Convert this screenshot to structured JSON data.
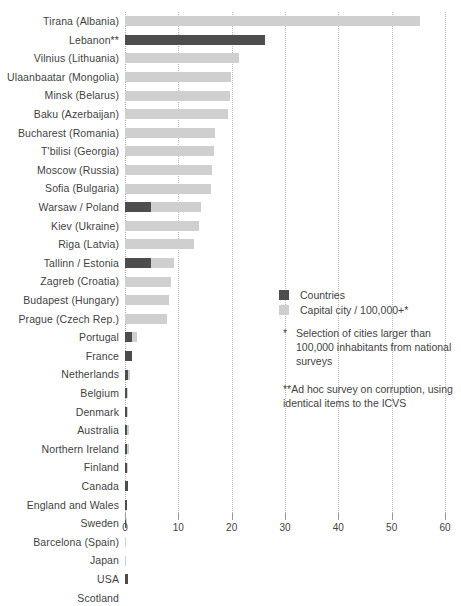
{
  "chart_data": {
    "type": "bar",
    "orientation": "horizontal",
    "title": "",
    "xlabel": "",
    "ylabel": "",
    "xlim": [
      0,
      60
    ],
    "xticks": [
      0,
      10,
      20,
      30,
      40,
      50,
      60
    ],
    "grid": true,
    "legend_position": "inside-right",
    "series": [
      {
        "name": "Countries",
        "color": "#4d4d4d"
      },
      {
        "name": "Capital city / 100,000+*",
        "color": "#cfcfcf"
      }
    ],
    "categories": [
      "Tirana (Albania)",
      "Lebanon**",
      "Vilnius (Lithuania)",
      "Ulaanbaatar (Mongolia)",
      "Minsk (Belarus)",
      "Baku (Azerbaijan)",
      "Bucharest (Romania)",
      "T'bilisi (Georgia)",
      "Moscow (Russia)",
      "Sofia (Bulgaria)",
      "Warsaw / Poland",
      "Kiev (Ukraine)",
      "Riga (Latvia)",
      "Tallinn / Estonia",
      "Zagreb (Croatia)",
      "Budapest (Hungary)",
      "Prague (Czech Rep.)",
      "Portugal",
      "France",
      "Netherlands",
      "Belgium",
      "Denmark",
      "Australia",
      "Northern Ireland",
      "Finland",
      "Canada",
      "England and Wales",
      "Sweden",
      "Barcelona (Spain)",
      "Japan",
      "USA",
      "Scotland"
    ],
    "rows": [
      {
        "label": "Tirana (Albania)",
        "city": 55.4,
        "country": 0
      },
      {
        "label": "Lebanon**",
        "city": 0,
        "country": 26.3
      },
      {
        "label": "Vilnius (Lithuania)",
        "city": 21.4,
        "country": 0
      },
      {
        "label": "Ulaanbaatar (Mongolia)",
        "city": 19.8,
        "country": 0
      },
      {
        "label": "Minsk (Belarus)",
        "city": 19.6,
        "country": 0
      },
      {
        "label": "Baku (Azerbaijan)",
        "city": 19.4,
        "country": 0
      },
      {
        "label": "Bucharest (Romania)",
        "city": 16.9,
        "country": 0
      },
      {
        "label": "T'bilisi (Georgia)",
        "city": 16.6,
        "country": 0
      },
      {
        "label": "Moscow (Russia)",
        "city": 16.4,
        "country": 0
      },
      {
        "label": "Sofia (Bulgaria)",
        "city": 16.2,
        "country": 0
      },
      {
        "label": "Warsaw / Poland",
        "city": 14.3,
        "country": 4.9
      },
      {
        "label": "Kiev (Ukraine)",
        "city": 13.9,
        "country": 0
      },
      {
        "label": "Riga (Latvia)",
        "city": 12.9,
        "country": 0
      },
      {
        "label": "Tallinn / Estonia",
        "city": 9.1,
        "country": 4.9
      },
      {
        "label": "Zagreb (Croatia)",
        "city": 8.6,
        "country": 0
      },
      {
        "label": "Budapest (Hungary)",
        "city": 8.3,
        "country": 0
      },
      {
        "label": "Prague (Czech Rep.)",
        "city": 7.9,
        "country": 0
      },
      {
        "label": "Portugal",
        "city": 2.3,
        "country": 1.4
      },
      {
        "label": "France",
        "city": 0,
        "country": 1.4
      },
      {
        "label": "Netherlands",
        "city": 0.9,
        "country": 0.5
      },
      {
        "label": "Belgium",
        "city": 0.6,
        "country": 0.4
      },
      {
        "label": "Denmark",
        "city": 0.5,
        "country": 0.4
      },
      {
        "label": "Australia",
        "city": 0.7,
        "country": 0.4
      },
      {
        "label": "Northern Ireland",
        "city": 0.8,
        "country": 0.4
      },
      {
        "label": "Finland",
        "city": 0.5,
        "country": 0.4
      },
      {
        "label": "Canada",
        "city": 0.5,
        "country": 0.5
      },
      {
        "label": "England and Wales",
        "city": 0.4,
        "country": 0.35
      },
      {
        "label": "Sweden",
        "city": 0.3,
        "country": 0.25
      },
      {
        "label": "Barcelona (Spain)",
        "city": 0.1,
        "country": 0
      },
      {
        "label": "Japan",
        "city": 0.1,
        "country": 0
      },
      {
        "label": "USA",
        "city": 0,
        "country": 0.5
      },
      {
        "label": "Scotland",
        "city": 0,
        "country": 0
      }
    ]
  },
  "legend": {
    "items": [
      {
        "label": "Countries",
        "color": "#4d4d4d"
      },
      {
        "label": "Capital city / 100,000+*",
        "color": "#cfcfcf"
      }
    ]
  },
  "notes": {
    "note1_marker": "*",
    "note1_text": "Selection of cities larger than 100,000 inhabitants from national surveys",
    "note2_text": "**Ad hoc survey on corruption, using identical items to the ICVS"
  },
  "axis": {
    "ticks": [
      "0",
      "10",
      "20",
      "30",
      "40",
      "50",
      "60"
    ]
  }
}
